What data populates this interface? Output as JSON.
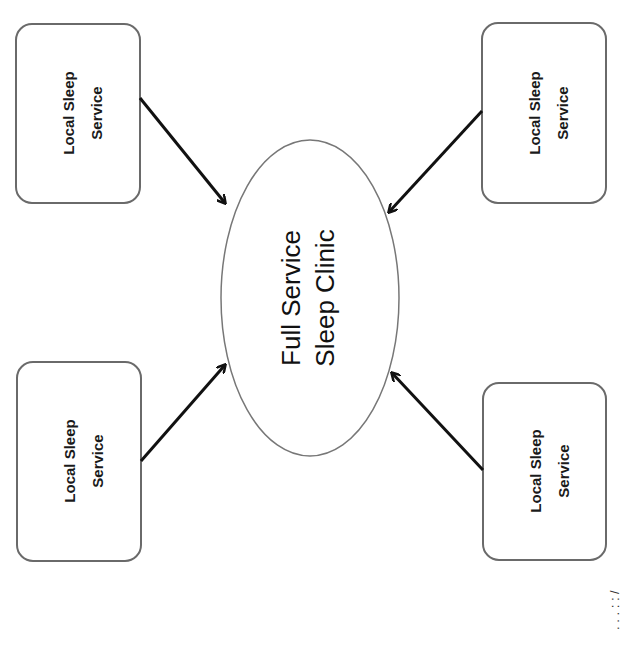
{
  "diagram": {
    "center": {
      "line1": "Full Service",
      "line2": "Sleep Clinic"
    },
    "nodes": [
      {
        "id": "top-left",
        "line1": "Local Sleep",
        "line2": "Service"
      },
      {
        "id": "top-right",
        "line1": "Local Sleep",
        "line2": "Service"
      },
      {
        "id": "bottom-left",
        "line1": "Local Sleep",
        "line2": "Service"
      },
      {
        "id": "bottom-right",
        "line1": "Local Sleep",
        "line2": "Service"
      }
    ],
    "edges": [
      {
        "from": "top-left",
        "to": "center"
      },
      {
        "from": "top-right",
        "to": "center"
      },
      {
        "from": "bottom-left",
        "to": "center"
      },
      {
        "from": "bottom-right",
        "to": "center"
      }
    ],
    "caption_fragment": ". . . :  :  /"
  }
}
